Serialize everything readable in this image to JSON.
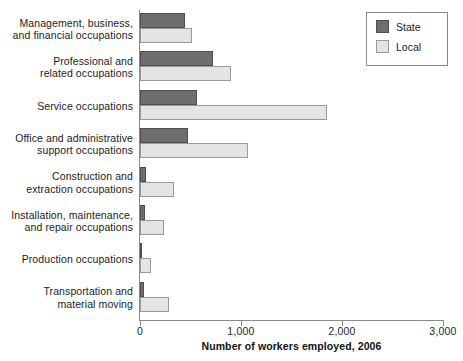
{
  "chart_data": {
    "type": "bar",
    "orientation": "horizontal",
    "title": "",
    "xlabel": "Number of workers employed, 2006",
    "ylabel": "",
    "xlim": [
      0,
      3000
    ],
    "xticks": [
      0,
      1000,
      2000,
      3000
    ],
    "xtick_labels": [
      "0",
      "1,000",
      "2,000",
      "3,000"
    ],
    "grid": false,
    "legend_position": "top-right",
    "categories": [
      "Management, business, and financial occupations",
      "Professional and related occupations",
      "Service occupations",
      "Office and administrative support occupations",
      "Construction and extraction occupations",
      "Installation, maintenance, and repair occupations",
      "Production occupations",
      "Transportation and material moving"
    ],
    "category_lines": [
      [
        "Management, business,",
        "and financial occupations"
      ],
      [
        "Professional and",
        "related occupations"
      ],
      [
        "Service occupations"
      ],
      [
        "Office and administrative",
        "support occupations"
      ],
      [
        "Construction and",
        "extraction occupations"
      ],
      [
        "Installation, maintenance,",
        "and repair occupations"
      ],
      [
        "Production occupations"
      ],
      [
        "Transportation and",
        "material moving"
      ]
    ],
    "series": [
      {
        "name": "State",
        "color": "#6e6e6e",
        "values": [
          450,
          720,
          560,
          480,
          60,
          50,
          20,
          40
        ]
      },
      {
        "name": "Local",
        "color": "#e4e4e4",
        "values": [
          510,
          900,
          1850,
          1070,
          340,
          240,
          110,
          290
        ]
      }
    ]
  },
  "legend": {
    "items": [
      {
        "label": "State",
        "swatch": "state"
      },
      {
        "label": "Local",
        "swatch": "local"
      }
    ]
  }
}
